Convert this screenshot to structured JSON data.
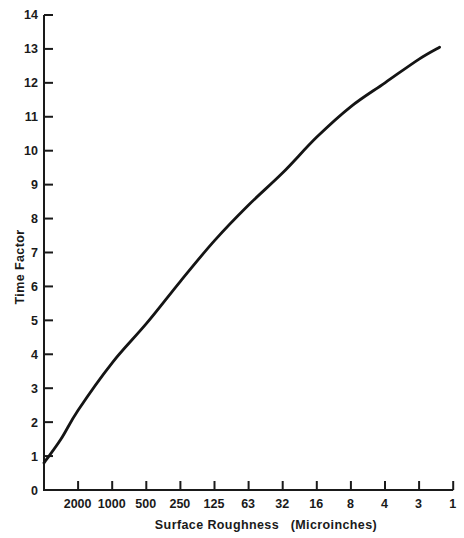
{
  "chart_data": {
    "type": "line",
    "title": "",
    "xlabel": "Surface Roughness (Microinches)",
    "ylabel": "Time Factor",
    "x_scale": "categorical (log-like, decreasing roughness)",
    "x_tick_labels": [
      "2000",
      "1000",
      "500",
      "250",
      "125",
      "63",
      "32",
      "16",
      "8",
      "4",
      "3",
      "1"
    ],
    "y_tick_labels": [
      "0",
      "1",
      "2",
      "3",
      "4",
      "5",
      "6",
      "7",
      "8",
      "9",
      "10",
      "11",
      "12",
      "13",
      "14"
    ],
    "ylim": [
      0,
      14
    ],
    "grid": false,
    "legend": null,
    "series": [
      {
        "name": "Time Factor vs Surface Roughness",
        "x_position": [
          0,
          0.5,
          1,
          2,
          3,
          4,
          5,
          6,
          7,
          8,
          9,
          10,
          11,
          11.6
        ],
        "x_label_at_position": [
          "start",
          "",
          "2000",
          "1000",
          "500",
          "250",
          "125",
          "63",
          "32",
          "16",
          "8",
          "4",
          "3",
          "near 1"
        ],
        "values": [
          0.8,
          1.5,
          2.35,
          3.75,
          4.9,
          6.15,
          7.35,
          8.4,
          9.35,
          10.4,
          11.3,
          12.0,
          12.7,
          13.05
        ]
      }
    ]
  },
  "labels": {
    "y_title": "Time Factor",
    "x_title": "Surface Roughness   (Microinches)"
  },
  "style": {
    "line_color": "#141414",
    "axis_color": "#1a1a1a",
    "background": "#ffffff"
  }
}
